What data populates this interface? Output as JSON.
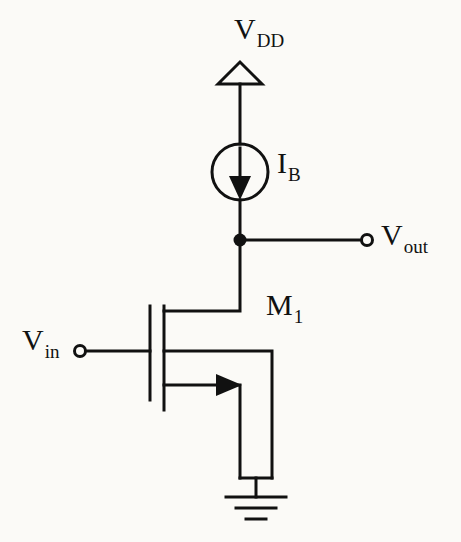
{
  "figure": {
    "kind": "circuit-schematic",
    "background_color": "#fbfaf7",
    "line_color": "#111111"
  },
  "labels": {
    "vdd": {
      "main": "V",
      "sub": "DD"
    },
    "ib": {
      "main": "I",
      "sub": "B"
    },
    "vout": {
      "main": "V",
      "sub": "out"
    },
    "m1": {
      "main": "M",
      "sub": "1"
    },
    "vin": {
      "main": "V",
      "sub": "in"
    }
  },
  "components": [
    {
      "name": "vdd-supply-arrow",
      "type": "supply-rail-arrow",
      "label": "VDD",
      "shape": "open-triangle",
      "apex": {
        "x": 240,
        "y": 62
      },
      "base_y": 84,
      "half_width": 22
    },
    {
      "name": "current-source-ib",
      "type": "current-source",
      "label": "IB",
      "center": {
        "x": 240,
        "y": 172
      },
      "radius": 28,
      "arrow_direction": "down"
    },
    {
      "name": "output-node",
      "type": "junction-dot",
      "position": {
        "x": 240,
        "y": 240
      },
      "radius": 6
    },
    {
      "name": "vout-terminal",
      "type": "open-terminal",
      "label": "Vout",
      "position": {
        "x": 367,
        "y": 240
      },
      "radius": 6
    },
    {
      "name": "vin-terminal",
      "type": "open-terminal",
      "label": "Vin",
      "position": {
        "x": 80,
        "y": 351
      },
      "radius": 6
    },
    {
      "name": "transistor-m1",
      "type": "nmos-transistor",
      "label": "M1",
      "gate_plate_x": 150,
      "channel_bar_x": 164,
      "gate_plate_y": [
        306,
        400
      ],
      "channel_bar_y": [
        306,
        410
      ],
      "drain_y": 311,
      "bulk_y": 351,
      "source_y": 385,
      "bulk_arrow_direction": "right"
    },
    {
      "name": "ground-symbol",
      "type": "ground",
      "position": {
        "x": 256,
        "y": 497
      },
      "bar_widths": [
        60,
        40,
        20
      ]
    }
  ],
  "wires": [
    {
      "name": "wire-vdd-to-source",
      "path": "240,84 -> 240,144"
    },
    {
      "name": "wire-source-to-output",
      "path": "240,200 -> 240,240"
    },
    {
      "name": "wire-output-to-vout",
      "path": "240,240 -> 361,240"
    },
    {
      "name": "wire-output-to-drain",
      "path": "240,240 -> 240,311 -> 164,311"
    },
    {
      "name": "wire-vin-to-gate",
      "path": "86,351 -> 150,351"
    },
    {
      "name": "wire-bulk-right-down",
      "path": "164,351 -> 272,351 -> 272,478"
    },
    {
      "name": "wire-source-down",
      "path": "164,385 -> 240,385 -> 240,478"
    },
    {
      "name": "wire-bottom-rail",
      "path": "240,478 -> 272,478"
    },
    {
      "name": "wire-ground-stub",
      "path": "256,478 -> 256,497"
    }
  ]
}
